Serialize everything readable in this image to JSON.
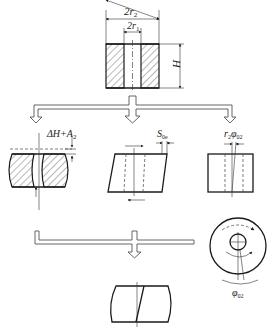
{
  "diagram": {
    "type": "deformation-modes-of-hollow-cylinder",
    "original": {
      "labels": {
        "outer_diameter": "2r",
        "outer_diameter_sub": "2",
        "inner_diameter": "2r",
        "inner_diameter_sub": "1",
        "height": "H"
      }
    },
    "compression": {
      "label": "ΔH+A",
      "label_sub": "2"
    },
    "shear": {
      "label": "S",
      "label_sub": "0e"
    },
    "torsion": {
      "label_r": "r",
      "label_r_sub": "2",
      "label_phi": "φ",
      "label_phi_sub": "02"
    },
    "torsion_top_view": {
      "label_phi": "φ",
      "label_phi_sub": "02"
    },
    "colors": {
      "line": "#1a1a1a",
      "arrow_outline": "#555555",
      "background": "#ffffff"
    }
  }
}
